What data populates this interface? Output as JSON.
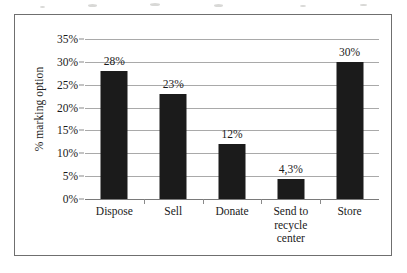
{
  "figure": {
    "frame_border_color": "#6f6f6f",
    "background_color": "#ffffff"
  },
  "chart_data": {
    "type": "bar",
    "title": "",
    "subtitle": "",
    "xlabel": "",
    "ylabel": "% marking option",
    "categories": [
      "Dispose",
      "Sell",
      "Donate",
      "Send to recycle center",
      "Store"
    ],
    "category_label_lines": [
      [
        "Dispose"
      ],
      [
        "Sell"
      ],
      [
        "Donate"
      ],
      [
        "Send to",
        "recycle",
        "center"
      ],
      [
        "Store"
      ]
    ],
    "values": [
      28,
      23,
      12,
      4.3,
      30
    ],
    "value_labels": [
      "28%",
      "23%",
      "12%",
      "4,3%",
      "30%"
    ],
    "bar_color": "#1b1b1b",
    "ylim": [
      0,
      35
    ],
    "ytick_values": [
      0,
      5,
      10,
      15,
      20,
      25,
      30,
      35
    ],
    "ytick_labels": [
      "0%",
      "5%",
      "10%",
      "15%",
      "20%",
      "25%",
      "30%",
      "35%"
    ],
    "grid": true,
    "grid_color": "#a9a9a9",
    "legend": null,
    "legend_position": "none",
    "annotations": []
  }
}
